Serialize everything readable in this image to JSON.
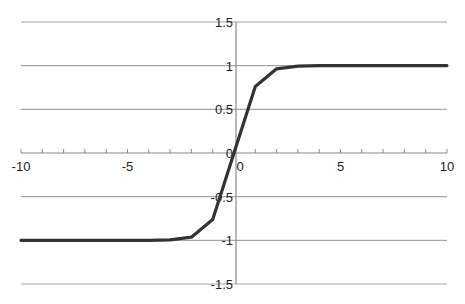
{
  "chart_data": {
    "type": "line",
    "title": "",
    "xlabel": "",
    "ylabel": "",
    "xlim": [
      -10,
      10
    ],
    "ylim": [
      -1.5,
      1.5
    ],
    "grid": {
      "horizontal": true,
      "vertical": false
    },
    "legend": null,
    "x_ticks": [
      -10,
      -5,
      0,
      5,
      10
    ],
    "x_tick_labels": [
      "-10",
      "-5",
      "0",
      "5",
      "10"
    ],
    "y_ticks": [
      1.5,
      1,
      0.5,
      0,
      -0.5,
      -1,
      -1.5
    ],
    "y_tick_labels": [
      "1.5",
      "1",
      "0.5",
      "0",
      "-0.5",
      "-1",
      "-1.5"
    ],
    "series": [
      {
        "name": "tanh(x)",
        "color": "#333333",
        "x": [
          -10,
          -9,
          -8,
          -7,
          -6,
          -5,
          -4,
          -3,
          -2,
          -1,
          0,
          1,
          2,
          3,
          4,
          5,
          6,
          7,
          8,
          9,
          10
        ],
        "values": [
          -1,
          -1,
          -1,
          -1,
          -1,
          -0.9999,
          -0.9993,
          -0.9951,
          -0.964,
          -0.7616,
          0,
          0.7616,
          0.964,
          0.9951,
          0.9993,
          0.9999,
          1,
          1,
          1,
          1,
          1
        ]
      }
    ]
  },
  "colors": {
    "grid": "#a6a6a6",
    "axis": "#8c8c8c",
    "line": "#333333",
    "text": "#222222"
  }
}
